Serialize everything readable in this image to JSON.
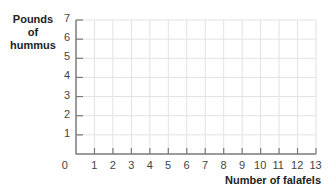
{
  "chart_data": {
    "type": "line",
    "title": "",
    "xlabel": "Number of falafels",
    "ylabel": "Pounds of hummus",
    "ylabel_lines": [
      "Pounds",
      "of",
      "hummus"
    ],
    "x_ticks": [
      0,
      1,
      2,
      3,
      4,
      5,
      6,
      7,
      8,
      9,
      10,
      11,
      12,
      13
    ],
    "y_ticks": [
      0,
      1,
      2,
      3,
      4,
      5,
      6,
      7
    ],
    "xlim": [
      0,
      13
    ],
    "ylim": [
      0,
      7
    ],
    "grid": true,
    "series": [],
    "legend": null
  },
  "colors": {
    "axis": "#7a7a7a",
    "grid": "#e2e2e2",
    "text": "#444444"
  }
}
